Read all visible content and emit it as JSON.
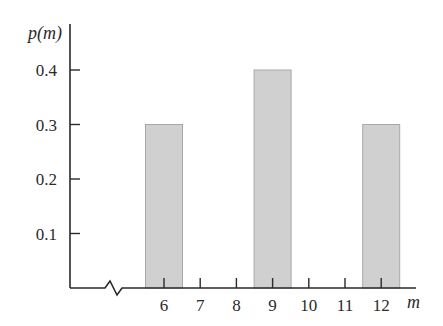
{
  "chart_data": {
    "type": "bar",
    "title": "",
    "xlabel": "m",
    "ylabel": "p(m)",
    "categories": [
      "6",
      "9",
      "12"
    ],
    "values": [
      0.3,
      0.4,
      0.3
    ],
    "x_ticks": [
      "6",
      "7",
      "8",
      "9",
      "10",
      "11",
      "12"
    ],
    "y_ticks": [
      "0.1",
      "0.2",
      "0.3",
      "0.4"
    ],
    "ylim": [
      0,
      0.45
    ],
    "xlim": [
      5,
      13
    ],
    "grid": false,
    "legend": null,
    "axis_break_on_x": true,
    "bar_color": "#d0d0d0",
    "bar_edge_color": "#a8a8a8",
    "axis_color": "#2a2a2a"
  }
}
